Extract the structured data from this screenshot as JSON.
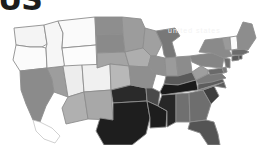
{
  "page": {
    "background_color": "#ffffff",
    "width": 264,
    "height": 145
  },
  "logo": {
    "text": "US",
    "color": "#1c1c1c",
    "note": "cropped bold glyphs at top-left corner"
  },
  "watermark": {
    "text": "united states",
    "color": "#f3f3f3"
  },
  "map": {
    "title": "United States choropleth map",
    "projection": "albers-usa",
    "border_color": "#8d8d8d",
    "ocean_color": "#ffffff",
    "scale": {
      "type": "grayscale",
      "lightest": "#ffffff",
      "darkest": "#151515",
      "bins": [
        "#ffffff",
        "#f2f2f2",
        "#e2e2e2",
        "#cfcfcf",
        "#b4b4b4",
        "#9a9a9a",
        "#7d7d7d",
        "#5e5e5e",
        "#3c3c3c",
        "#1e1e1e"
      ]
    },
    "regions": [
      {
        "code": "WA",
        "name": "Washington",
        "fill": "#f4f4f4"
      },
      {
        "code": "OR",
        "name": "Oregon",
        "fill": "#fbfbfb"
      },
      {
        "code": "CA",
        "name": "California",
        "fill": "#8b8b8b"
      },
      {
        "code": "NV",
        "name": "Nevada",
        "fill": "#9d9d9d"
      },
      {
        "code": "ID",
        "name": "Idaho",
        "fill": "#f6f6f6"
      },
      {
        "code": "MT",
        "name": "Montana",
        "fill": "#fafafa"
      },
      {
        "code": "WY",
        "name": "Wyoming",
        "fill": "#fcfcfc"
      },
      {
        "code": "UT",
        "name": "Utah",
        "fill": "#ededed"
      },
      {
        "code": "AZ",
        "name": "Arizona",
        "fill": "#b0b0b0"
      },
      {
        "code": "CO",
        "name": "Colorado",
        "fill": "#f0f0f0"
      },
      {
        "code": "NM",
        "name": "New Mexico",
        "fill": "#a8a8a8"
      },
      {
        "code": "ND",
        "name": "North Dakota",
        "fill": "#8e8e8e"
      },
      {
        "code": "SD",
        "name": "South Dakota",
        "fill": "#8a8a8a"
      },
      {
        "code": "NE",
        "name": "Nebraska",
        "fill": "#a4a4a4"
      },
      {
        "code": "KS",
        "name": "Kansas",
        "fill": "#b8b8b8"
      },
      {
        "code": "OK",
        "name": "Oklahoma",
        "fill": "#2a2a2a"
      },
      {
        "code": "TX",
        "name": "Texas",
        "fill": "#1e1e1e"
      },
      {
        "code": "MN",
        "name": "Minnesota",
        "fill": "#9c9c9c"
      },
      {
        "code": "IA",
        "name": "Iowa",
        "fill": "#aeaeae"
      },
      {
        "code": "MO",
        "name": "Missouri",
        "fill": "#8f8f8f"
      },
      {
        "code": "AR",
        "name": "Arkansas",
        "fill": "#4a4a4a"
      },
      {
        "code": "LA",
        "name": "Louisiana",
        "fill": "#1d1d1d"
      },
      {
        "code": "WI",
        "name": "Wisconsin",
        "fill": "#a0a0a0"
      },
      {
        "code": "IL",
        "name": "Illinois",
        "fill": "#909090"
      },
      {
        "code": "MI",
        "name": "Michigan",
        "fill": "#787878"
      },
      {
        "code": "IN",
        "name": "Indiana",
        "fill": "#9b9b9b"
      },
      {
        "code": "OH",
        "name": "Ohio",
        "fill": "#8c8c8c"
      },
      {
        "code": "KY",
        "name": "Kentucky",
        "fill": "#5a5a5a"
      },
      {
        "code": "TN",
        "name": "Tennessee",
        "fill": "#1a1a1a"
      },
      {
        "code": "MS",
        "name": "Mississippi",
        "fill": "#272727"
      },
      {
        "code": "AL",
        "name": "Alabama",
        "fill": "#707070"
      },
      {
        "code": "GA",
        "name": "Georgia",
        "fill": "#6e6e6e"
      },
      {
        "code": "FL",
        "name": "Florida",
        "fill": "#545454"
      },
      {
        "code": "SC",
        "name": "South Carolina",
        "fill": "#3e3e3e"
      },
      {
        "code": "NC",
        "name": "North Carolina",
        "fill": "#5c5c5c"
      },
      {
        "code": "VA",
        "name": "Virginia",
        "fill": "#7a7a7a"
      },
      {
        "code": "WV",
        "name": "West Virginia",
        "fill": "#9e9e9e"
      },
      {
        "code": "MD",
        "name": "Maryland",
        "fill": "#6a6a6a"
      },
      {
        "code": "DE",
        "name": "Delaware",
        "fill": "#7c7c7c"
      },
      {
        "code": "PA",
        "name": "Pennsylvania",
        "fill": "#858585"
      },
      {
        "code": "NJ",
        "name": "New Jersey",
        "fill": "#6d6d6d"
      },
      {
        "code": "NY",
        "name": "New York",
        "fill": "#8a8a8a"
      },
      {
        "code": "CT",
        "name": "Connecticut",
        "fill": "#5b5b5b"
      },
      {
        "code": "RI",
        "name": "Rhode Island",
        "fill": "#4f4f4f"
      },
      {
        "code": "MA",
        "name": "Massachusetts",
        "fill": "#6c6c6c"
      },
      {
        "code": "VT",
        "name": "Vermont",
        "fill": "#9a9a9a"
      },
      {
        "code": "NH",
        "name": "New Hampshire",
        "fill": "#fbfbfb"
      },
      {
        "code": "ME",
        "name": "Maine",
        "fill": "#8d8d8d"
      },
      {
        "code": "MX-BC",
        "name": "Baja California outline",
        "fill": "#ffffff"
      }
    ]
  }
}
